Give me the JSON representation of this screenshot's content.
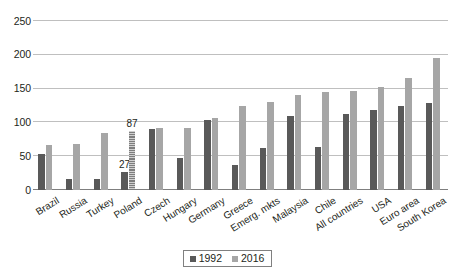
{
  "chart_data": {
    "type": "bar",
    "title": "",
    "subtitle": "",
    "xlabel": "",
    "ylabel": "",
    "ylim": [
      0,
      250
    ],
    "yticks": [
      0,
      50,
      100,
      150,
      200,
      250
    ],
    "grid": true,
    "legend_position": "bottom",
    "orientation": "vertical",
    "grouping": "grouped",
    "categories": [
      "Brazil",
      "Russia",
      "Turkey",
      "Poland",
      "Czech",
      "Hungary",
      "Germany",
      "Greece",
      "Emerg. mkts",
      "Malaysia",
      "Chile",
      "All countries",
      "USA",
      "Euro area",
      "South Korea"
    ],
    "series": [
      {
        "name": "1992",
        "color": "#595959",
        "values": [
          53,
          16,
          17,
          27,
          90,
          48,
          104,
          37,
          62,
          110,
          64,
          112,
          118,
          124,
          129
        ]
      },
      {
        "name": "2016",
        "color": "#a6a6a6",
        "values": [
          66,
          68,
          85,
          87,
          91,
          92,
          106,
          124,
          130,
          140,
          145,
          146,
          152,
          165,
          196
        ]
      }
    ],
    "data_labels": [
      {
        "category": "Poland",
        "series": "1992",
        "text": "27"
      },
      {
        "category": "Poland",
        "series": "2016",
        "text": "87"
      }
    ]
  },
  "legend": {
    "items": [
      {
        "label": "1992",
        "color": "#595959"
      },
      {
        "label": "2016",
        "color": "#a6a6a6"
      }
    ]
  },
  "axes": {
    "y_tick_labels": [
      "250",
      "200",
      "150",
      "100",
      "50",
      "0"
    ]
  },
  "colors": {
    "series_1992": "#595959",
    "series_2016": "#a6a6a6",
    "gridline": "#bfbfbf",
    "baseline": "#7f7f7f",
    "text": "#231f20",
    "background": "#ffffff"
  }
}
